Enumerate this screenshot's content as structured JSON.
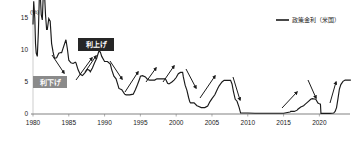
{
  "chart_data": {
    "type": "line",
    "title": "",
    "xlabel": "",
    "ylabel": "(%)",
    "unit_label": "(%)",
    "xlim": [
      1980,
      2024
    ],
    "ylim": [
      0,
      15
    ],
    "yticks": [
      0,
      5,
      10,
      15
    ],
    "ytick_labels": [
      "0",
      "5",
      "10",
      "15"
    ],
    "xticks": [
      1980,
      1985,
      1990,
      1995,
      2000,
      2005,
      2010,
      2015,
      2020
    ],
    "xtick_labels": [
      "1980",
      "1985",
      "1990",
      "1995",
      "2000",
      "2005",
      "2010",
      "2015",
      "2020"
    ],
    "grid": false,
    "legend_position": "top-right",
    "series": [
      {
        "name": "政策金利（米国）",
        "color": "#1a1a1a",
        "points": [
          [
            1980.0,
            14.0
          ],
          [
            1980.1,
            17.6
          ],
          [
            1980.25,
            15.0
          ],
          [
            1980.35,
            11.0
          ],
          [
            1980.45,
            9.5
          ],
          [
            1980.6,
            9.0
          ],
          [
            1980.75,
            12.8
          ],
          [
            1980.9,
            18.9
          ],
          [
            1981.0,
            19.1
          ],
          [
            1981.15,
            15.5
          ],
          [
            1981.3,
            14.7
          ],
          [
            1981.45,
            19.1
          ],
          [
            1981.6,
            19.0
          ],
          [
            1981.75,
            15.5
          ],
          [
            1981.9,
            13.2
          ],
          [
            1982.0,
            13.2
          ],
          [
            1982.2,
            14.9
          ],
          [
            1982.4,
            14.5
          ],
          [
            1982.6,
            11.0
          ],
          [
            1982.8,
            9.7
          ],
          [
            1983.0,
            8.7
          ],
          [
            1983.3,
            8.8
          ],
          [
            1983.6,
            9.5
          ],
          [
            1983.9,
            9.6
          ],
          [
            1984.0,
            9.6
          ],
          [
            1984.3,
            10.6
          ],
          [
            1984.6,
            11.6
          ],
          [
            1984.8,
            10.2
          ],
          [
            1985.0,
            8.4
          ],
          [
            1985.3,
            8.0
          ],
          [
            1985.6,
            7.9
          ],
          [
            1985.9,
            8.1
          ],
          [
            1986.0,
            8.0
          ],
          [
            1986.3,
            6.9
          ],
          [
            1986.6,
            6.2
          ],
          [
            1986.9,
            6.0
          ],
          [
            1987.0,
            6.1
          ],
          [
            1987.3,
            6.5
          ],
          [
            1987.6,
            7.0
          ],
          [
            1987.9,
            6.8
          ],
          [
            1988.0,
            6.6
          ],
          [
            1988.3,
            7.2
          ],
          [
            1988.6,
            8.0
          ],
          [
            1988.9,
            8.7
          ],
          [
            1989.0,
            9.1
          ],
          [
            1989.2,
            9.8
          ],
          [
            1989.4,
            9.7
          ],
          [
            1989.6,
            9.0
          ],
          [
            1989.9,
            8.4
          ],
          [
            1990.0,
            8.2
          ],
          [
            1990.4,
            8.2
          ],
          [
            1990.8,
            7.8
          ],
          [
            1991.0,
            6.9
          ],
          [
            1991.3,
            5.9
          ],
          [
            1991.6,
            5.5
          ],
          [
            1991.9,
            4.4
          ],
          [
            1992.0,
            4.0
          ],
          [
            1992.4,
            3.8
          ],
          [
            1992.8,
            3.1
          ],
          [
            1993.0,
            3.0
          ],
          [
            1993.5,
            3.0
          ],
          [
            1994.0,
            3.1
          ],
          [
            1994.3,
            3.8
          ],
          [
            1994.6,
            4.6
          ],
          [
            1994.9,
            5.5
          ],
          [
            1995.0,
            5.9
          ],
          [
            1995.3,
            6.0
          ],
          [
            1995.7,
            5.8
          ],
          [
            1996.0,
            5.4
          ],
          [
            1996.3,
            5.3
          ],
          [
            1996.7,
            5.3
          ],
          [
            1997.0,
            5.3
          ],
          [
            1997.3,
            5.5
          ],
          [
            1997.7,
            5.5
          ],
          [
            1998.0,
            5.5
          ],
          [
            1998.5,
            5.5
          ],
          [
            1998.8,
            4.8
          ],
          [
            1999.0,
            4.7
          ],
          [
            1999.4,
            5.0
          ],
          [
            1999.7,
            5.3
          ],
          [
            2000.0,
            5.7
          ],
          [
            2000.3,
            6.3
          ],
          [
            2000.6,
            6.5
          ],
          [
            2000.9,
            6.5
          ],
          [
            2001.0,
            5.8
          ],
          [
            2001.25,
            4.5
          ],
          [
            2001.5,
            3.7
          ],
          [
            2001.75,
            2.5
          ],
          [
            2001.9,
            1.9
          ],
          [
            2002.0,
            1.75
          ],
          [
            2002.5,
            1.75
          ],
          [
            2002.9,
            1.3
          ],
          [
            2003.0,
            1.25
          ],
          [
            2003.5,
            1.0
          ],
          [
            2004.0,
            1.0
          ],
          [
            2004.4,
            1.25
          ],
          [
            2004.7,
            1.9
          ],
          [
            2005.0,
            2.4
          ],
          [
            2005.4,
            3.0
          ],
          [
            2005.8,
            4.0
          ],
          [
            2006.0,
            4.4
          ],
          [
            2006.4,
            5.0
          ],
          [
            2006.7,
            5.25
          ],
          [
            2007.0,
            5.25
          ],
          [
            2007.6,
            5.25
          ],
          [
            2007.8,
            4.7
          ],
          [
            2008.0,
            3.5
          ],
          [
            2008.25,
            2.3
          ],
          [
            2008.5,
            2.0
          ],
          [
            2008.8,
            1.0
          ],
          [
            2009.0,
            0.15
          ],
          [
            2009.5,
            0.15
          ],
          [
            2010.0,
            0.15
          ],
          [
            2011.0,
            0.12
          ],
          [
            2012.0,
            0.12
          ],
          [
            2013.0,
            0.12
          ],
          [
            2014.0,
            0.12
          ],
          [
            2015.0,
            0.12
          ],
          [
            2015.9,
            0.3
          ],
          [
            2016.0,
            0.4
          ],
          [
            2016.5,
            0.4
          ],
          [
            2016.9,
            0.6
          ],
          [
            2017.0,
            0.75
          ],
          [
            2017.4,
            1.1
          ],
          [
            2017.8,
            1.3
          ],
          [
            2018.0,
            1.5
          ],
          [
            2018.4,
            1.9
          ],
          [
            2018.8,
            2.3
          ],
          [
            2019.0,
            2.4
          ],
          [
            2019.5,
            2.3
          ],
          [
            2019.8,
            1.7
          ],
          [
            2020.0,
            1.6
          ],
          [
            2020.15,
            1.55
          ],
          [
            2020.22,
            0.1
          ],
          [
            2020.5,
            0.1
          ],
          [
            2021.0,
            0.1
          ],
          [
            2021.5,
            0.1
          ],
          [
            2022.0,
            0.15
          ],
          [
            2022.2,
            0.4
          ],
          [
            2022.4,
            1.0
          ],
          [
            2022.6,
            2.4
          ],
          [
            2022.8,
            3.9
          ],
          [
            2023.0,
            4.6
          ],
          [
            2023.3,
            5.1
          ],
          [
            2023.6,
            5.3
          ],
          [
            2024.0,
            5.3
          ],
          [
            2024.4,
            5.3
          ]
        ]
      }
    ],
    "annotations": [
      {
        "id": "hike-box",
        "label": "利上げ",
        "style": "dark",
        "bg": "#262626",
        "fg": "#ffffff",
        "x": 78,
        "y": 38,
        "w": 36,
        "h": 13
      },
      {
        "id": "cut-box",
        "label": "利下げ",
        "style": "gray",
        "bg": "#8a8a8a",
        "fg": "#ffffff",
        "x": 33,
        "y": 76,
        "w": 34,
        "h": 12
      }
    ],
    "arrows": [
      {
        "id": "cut-arrow-1",
        "direction": "down",
        "x1": 52,
        "y1": 55,
        "x2": 64,
        "y2": 73
      },
      {
        "id": "hike-arrow-1",
        "direction": "up",
        "x1": 76,
        "y1": 80,
        "x2": 92,
        "y2": 58
      },
      {
        "id": "hike-arrow-2",
        "direction": "up",
        "x1": 85,
        "y1": 72,
        "x2": 96,
        "y2": 56
      },
      {
        "id": "cut-arrow-2",
        "direction": "down",
        "x1": 110,
        "y1": 61,
        "x2": 122,
        "y2": 79
      },
      {
        "id": "hike-arrow-3",
        "direction": "up",
        "x1": 125,
        "y1": 92,
        "x2": 138,
        "y2": 72
      },
      {
        "id": "hike-arrow-4",
        "direction": "up",
        "x1": 146,
        "y1": 82,
        "x2": 156,
        "y2": 68
      },
      {
        "id": "hike-arrow-5",
        "direction": "up",
        "x1": 163,
        "y1": 82,
        "x2": 174,
        "y2": 66
      },
      {
        "id": "cut-arrow-3",
        "direction": "down",
        "x1": 186,
        "y1": 69,
        "x2": 196,
        "y2": 88
      },
      {
        "id": "hike-arrow-6",
        "direction": "up",
        "x1": 200,
        "y1": 98,
        "x2": 215,
        "y2": 76
      },
      {
        "id": "cut-arrow-4",
        "direction": "down",
        "x1": 233,
        "y1": 77,
        "x2": 240,
        "y2": 100
      },
      {
        "id": "hike-arrow-7",
        "direction": "up",
        "x1": 282,
        "y1": 108,
        "x2": 297,
        "y2": 92
      },
      {
        "id": "cut-arrow-5",
        "direction": "down",
        "x1": 308,
        "y1": 80,
        "x2": 316,
        "y2": 98
      },
      {
        "id": "hike-arrow-8",
        "direction": "up",
        "x1": 330,
        "y1": 103,
        "x2": 336,
        "y2": 82
      }
    ]
  },
  "legend": {
    "entries": [
      {
        "label": "政策金利（米国）",
        "color": "#1a1a1a"
      }
    ]
  },
  "axis": {
    "unit": "(%)"
  }
}
